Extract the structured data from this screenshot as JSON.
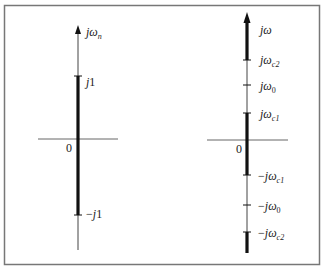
{
  "diagram": {
    "frame": {
      "stroke": "#777777"
    },
    "colors": {
      "axis_thin": "#555555",
      "axis_thick": "#111111",
      "text": "#222222"
    },
    "left_panel": {
      "axis_label": {
        "j": "j",
        "omega": "ω",
        "sub": "n"
      },
      "origin": "0",
      "ticks": [
        {
          "id": "j1",
          "label": "j1",
          "sign": "",
          "j": "j",
          "rest": "1"
        },
        {
          "id": "neg-j1",
          "label": "−j1",
          "sign": "−",
          "j": "j",
          "rest": "1"
        }
      ]
    },
    "right_panel": {
      "axis_label": {
        "j": "j",
        "omega": "ω"
      },
      "origin": "0",
      "ticks": [
        {
          "id": "jwc2",
          "sign": "",
          "sub": "c2",
          "label": "jωc2"
        },
        {
          "id": "jw0",
          "sign": "",
          "sub": "0",
          "label": "jω0"
        },
        {
          "id": "jwc1",
          "sign": "",
          "sub": "c1",
          "label": "jωc1"
        },
        {
          "id": "neg-jwc1",
          "sign": "−",
          "sub": "c1",
          "label": "−jωc1"
        },
        {
          "id": "neg-jw0",
          "sign": "−",
          "sub": "0",
          "label": "−jω0"
        },
        {
          "id": "neg-jwc2",
          "sign": "−",
          "sub": "c2",
          "label": "−jωc2"
        }
      ]
    }
  }
}
